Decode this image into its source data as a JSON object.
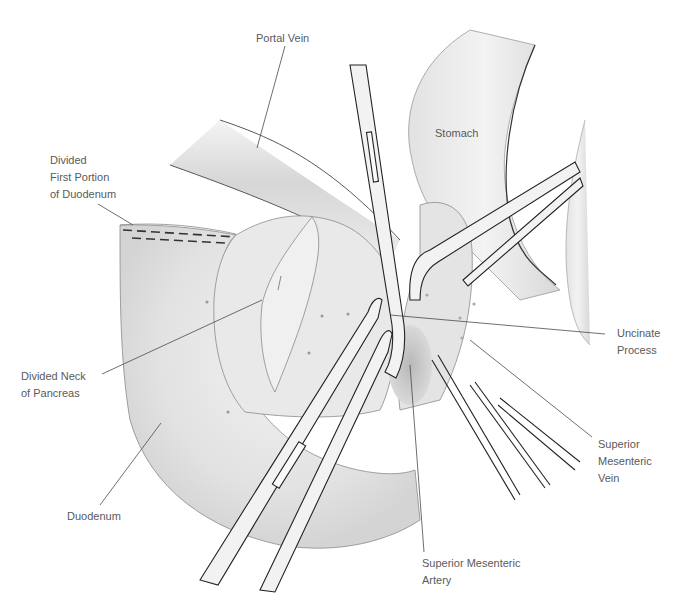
{
  "figure": {
    "type": "surgical-anatomical-illustration",
    "colors": {
      "background": "#ffffff",
      "tissue": "#e6e6e6",
      "tissue_shadow": "#c8c8c8",
      "outline": "#8a8a8a",
      "instrument_outline": "#222222",
      "instrument_fill": "#f2f2f2",
      "label_text": "#5a5a5a",
      "leader_line": "#4a4a4a",
      "suture": "#333333"
    }
  },
  "labels": {
    "portal_vein": {
      "lines": [
        "Portal Vein"
      ]
    },
    "stomach": {
      "lines": [
        "Stomach"
      ]
    },
    "divided_first_portion": {
      "lines": [
        "Divided",
        "First Portion",
        "of Duodenum"
      ]
    },
    "divided_neck": {
      "lines": [
        "Divided Neck",
        "of Pancreas"
      ]
    },
    "uncinate_process": {
      "lines": [
        "Uncinate",
        "Process"
      ]
    },
    "smv": {
      "lines": [
        "Superior",
        "Mesenteric",
        "Vein"
      ]
    },
    "duodenum": {
      "lines": [
        "Duodenum"
      ]
    },
    "sma": {
      "lines": [
        "Superior Mesenteric",
        "Artery"
      ]
    }
  }
}
